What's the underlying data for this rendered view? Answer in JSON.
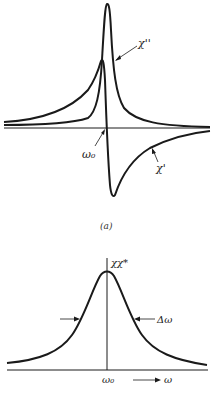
{
  "figure_a": {
    "caption": "(a)",
    "labels": {
      "chi_double_prime": "χ''",
      "chi_prime": "χ'",
      "omega0": "ω₀"
    },
    "curves": [
      {
        "name": "chi_double_prime",
        "shape": "absorption (Lorentzian) peak at ω0"
      },
      {
        "name": "chi_prime",
        "shape": "dispersion curve crossing zero at ω0"
      }
    ]
  },
  "figure_b": {
    "labels": {
      "chi_chi_star": "χχ*",
      "linewidth": "Δω",
      "omega0": "ω₀",
      "omega_axis": "ω"
    },
    "curves": [
      {
        "name": "chi_chi_star",
        "shape": "Lorentzian peak centered at ω0 with full width Δω"
      }
    ]
  },
  "colors": {
    "line": "#1a1a1a",
    "background": "#ffffff"
  }
}
